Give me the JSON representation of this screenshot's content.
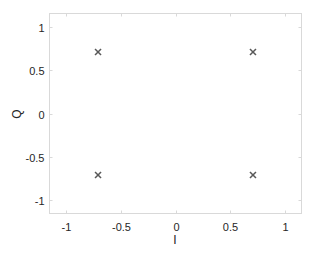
{
  "chart_data": {
    "type": "scatter",
    "title": "",
    "xlabel": "I",
    "ylabel": "Q",
    "xlim": [
      -1.15,
      1.15
    ],
    "ylim": [
      -1.15,
      1.15
    ],
    "xticks": [
      -1,
      -0.5,
      0,
      0.5,
      1
    ],
    "yticks": [
      -1,
      -0.5,
      0,
      0.5,
      1
    ],
    "xtick_labels": [
      "-1",
      "-0.5",
      "0",
      "0.5",
      "1"
    ],
    "ytick_labels": [
      "-1",
      "-0.5",
      "0",
      "0.5",
      "1"
    ],
    "grid": false,
    "legend": null,
    "marker": "x",
    "marker_color": "#595959",
    "series": [
      {
        "name": "constellation",
        "x": [
          -0.707,
          0.707,
          -0.707,
          0.707
        ],
        "y": [
          0.707,
          0.707,
          -0.707,
          -0.707
        ]
      }
    ]
  },
  "colors": {
    "axes": "#d9d9d9",
    "text": "#262626",
    "marker": "#595959"
  }
}
